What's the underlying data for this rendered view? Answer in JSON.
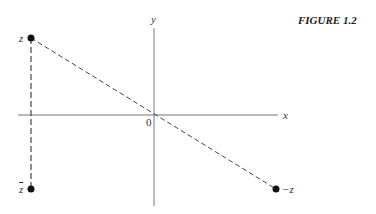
{
  "figure_label": "FIGURE 1.2",
  "axes": {
    "x_label": "x",
    "y_label": "y",
    "origin_label": "0"
  },
  "points": [
    {
      "name": "z",
      "label": "z"
    },
    {
      "name": "z-conjugate",
      "label": "z"
    },
    {
      "name": "negative-z",
      "label": "−z"
    }
  ],
  "colors": {
    "axis": "#777777",
    "line": "#444444",
    "point": "#111111"
  }
}
